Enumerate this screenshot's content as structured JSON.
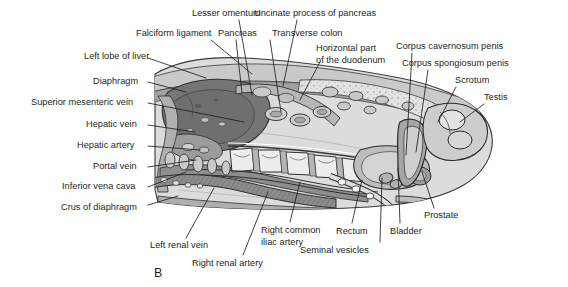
{
  "figure": {
    "letter": "B",
    "letter_pos": {
      "x": 154,
      "y": 266
    },
    "caption_color": "#231f20"
  },
  "colors": {
    "ink": "#231f20",
    "leader": "#231f20",
    "body_outline": "#3a3a3a",
    "skin_light": "#d9d9d9",
    "fat_pale": "#e4e4e4",
    "liver_dark": "#777777",
    "muscle_mid": "#9a9a9a",
    "organ_light": "#c6c6c6",
    "bone_pale": "#ebebeb",
    "shadow": "#8a8a8a",
    "background": "#ffffff"
  },
  "labels": [
    {
      "id": "lesser-omentum",
      "text": "Lesser omentum",
      "x": 192,
      "y": 8,
      "align": "left",
      "anchor": {
        "x": 239,
        "y": 20
      },
      "target": {
        "x": 252,
        "y": 95
      }
    },
    {
      "id": "uncinate-process-of-pancreas",
      "text": "Uncinate process of pancreas",
      "x": 254,
      "y": 8,
      "align": "left",
      "anchor": {
        "x": 297,
        "y": 20
      },
      "target": {
        "x": 283,
        "y": 86
      }
    },
    {
      "id": "falciform-ligament",
      "text": "Falciform ligament",
      "x": 136,
      "y": 28,
      "align": "left",
      "anchor": {
        "x": 211,
        "y": 40
      },
      "target": {
        "x": 252,
        "y": 74
      }
    },
    {
      "id": "pancreas",
      "text": "Pancreas",
      "x": 218,
      "y": 28,
      "align": "left",
      "anchor": {
        "x": 236,
        "y": 40
      },
      "target": {
        "x": 242,
        "y": 93
      }
    },
    {
      "id": "transverse-colon",
      "text": "Transverse colon",
      "x": 272,
      "y": 28,
      "align": "left",
      "anchor": {
        "x": 270,
        "y": 40
      },
      "target": {
        "x": 281,
        "y": 112
      }
    },
    {
      "id": "horizontal-part-of-the-duodenum",
      "text": "Horizontal part\nof the duodenum",
      "x": 316,
      "y": 43,
      "align": "left",
      "anchor": {
        "x": 320,
        "y": 62
      },
      "target": {
        "x": 300,
        "y": 100
      }
    },
    {
      "id": "corpus-cavernosum-penis",
      "text": "Corpus cavernosum penis",
      "x": 396,
      "y": 41,
      "align": "left",
      "anchor": {
        "x": 412,
        "y": 53
      },
      "target": {
        "x": 406,
        "y": 155
      }
    },
    {
      "id": "corpus-spongiosum-penis",
      "text": "Corpus spongiosum penis",
      "x": 402,
      "y": 58,
      "align": "left",
      "anchor": {
        "x": 428,
        "y": 70
      },
      "target": {
        "x": 416,
        "y": 152
      }
    },
    {
      "id": "scrotum",
      "text": "Scrotum",
      "x": 455,
      "y": 75,
      "align": "left",
      "anchor": {
        "x": 456,
        "y": 87
      },
      "target": {
        "x": 438,
        "y": 122
      }
    },
    {
      "id": "testis",
      "text": "Testis",
      "x": 484,
      "y": 92,
      "align": "left",
      "anchor": {
        "x": 484,
        "y": 104
      },
      "target": {
        "x": 460,
        "y": 122
      }
    },
    {
      "id": "left-lobe-of-liver",
      "text": "Left lobe of liver",
      "x": 84,
      "y": 51,
      "align": "left",
      "anchor": {
        "x": 148,
        "y": 58
      },
      "target": {
        "x": 206,
        "y": 78
      }
    },
    {
      "id": "diaphragm",
      "text": "Diaphragm",
      "x": 93,
      "y": 76,
      "align": "left",
      "anchor": {
        "x": 148,
        "y": 82
      },
      "target": {
        "x": 186,
        "y": 92
      }
    },
    {
      "id": "superior-mesenteric-vein",
      "text": "Superior mesenteric vein",
      "x": 31,
      "y": 97,
      "align": "left",
      "anchor": {
        "x": 148,
        "y": 103
      },
      "target": {
        "x": 244,
        "y": 122
      }
    },
    {
      "id": "hepatic-vein",
      "text": "Hepatic vein",
      "x": 86,
      "y": 119,
      "align": "left",
      "anchor": {
        "x": 148,
        "y": 125
      },
      "target": {
        "x": 195,
        "y": 132
      }
    },
    {
      "id": "hepatic-artery",
      "text": "Hepatic artery",
      "x": 77,
      "y": 140,
      "align": "left",
      "anchor": {
        "x": 148,
        "y": 146
      },
      "target": {
        "x": 200,
        "y": 150
      }
    },
    {
      "id": "portal-vein",
      "text": "Portal vein",
      "x": 93,
      "y": 161,
      "align": "left",
      "anchor": {
        "x": 148,
        "y": 167
      },
      "target": {
        "x": 196,
        "y": 160
      }
    },
    {
      "id": "inferior-vena-cava",
      "text": "Inferior vena cava",
      "x": 62,
      "y": 181,
      "align": "left",
      "anchor": {
        "x": 148,
        "y": 187
      },
      "target": {
        "x": 186,
        "y": 172
      }
    },
    {
      "id": "crus-of-diaphragm",
      "text": "Crus of diaphragm",
      "x": 61,
      "y": 202,
      "align": "left",
      "anchor": {
        "x": 148,
        "y": 205
      },
      "target": {
        "x": 178,
        "y": 196
      }
    },
    {
      "id": "left-renal-vein",
      "text": "Left renal vein",
      "x": 150,
      "y": 240,
      "align": "left",
      "anchor": {
        "x": 186,
        "y": 238
      },
      "target": {
        "x": 214,
        "y": 188
      }
    },
    {
      "id": "right-renal-artery",
      "text": "Right renal artery",
      "x": 192,
      "y": 258,
      "align": "left",
      "anchor": {
        "x": 243,
        "y": 255
      },
      "target": {
        "x": 268,
        "y": 192
      }
    },
    {
      "id": "right-common-iliac-artery",
      "text": "Right common\niliac artery",
      "x": 261,
      "y": 225,
      "align": "left",
      "anchor": {
        "x": 290,
        "y": 222
      },
      "target": {
        "x": 300,
        "y": 182
      }
    },
    {
      "id": "rectum",
      "text": "Rectum",
      "x": 336,
      "y": 226,
      "align": "left",
      "anchor": {
        "x": 352,
        "y": 223
      },
      "target": {
        "x": 362,
        "y": 180
      }
    },
    {
      "id": "seminal-vesicles",
      "text": "Seminal vesicles",
      "x": 300,
      "y": 245,
      "align": "left",
      "anchor": {
        "x": 380,
        "y": 242
      },
      "target": {
        "x": 382,
        "y": 178
      }
    },
    {
      "id": "bladder",
      "text": "Bladder",
      "x": 390,
      "y": 226,
      "align": "left",
      "anchor": {
        "x": 400,
        "y": 223
      },
      "target": {
        "x": 398,
        "y": 168
      }
    },
    {
      "id": "prostate",
      "text": "Prostate",
      "x": 424,
      "y": 210,
      "align": "left",
      "anchor": {
        "x": 434,
        "y": 208
      },
      "target": {
        "x": 422,
        "y": 172
      }
    }
  ]
}
